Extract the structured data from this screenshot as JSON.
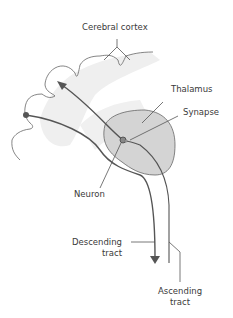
{
  "labels": {
    "cerebral_cortex": "Cerebral cortex",
    "thalamus": "Thalamus",
    "synapse": "Synapse",
    "neuron": "Neuron",
    "descending_tract_1": "Descending",
    "descending_tract_2": "tract",
    "ascending_tract_1": "Ascending",
    "ascending_tract_2": "tract"
  },
  "colors": {
    "line": "#555555",
    "thalamus_fill": "#d4d4d4",
    "cortex_fill": "#efefef",
    "text": "#3a3a3a"
  }
}
